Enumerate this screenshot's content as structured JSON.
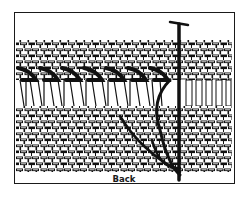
{
  "figure": {
    "caption": "Back",
    "colors": {
      "ink": "#111111",
      "paper": "#ffffff"
    }
  }
}
